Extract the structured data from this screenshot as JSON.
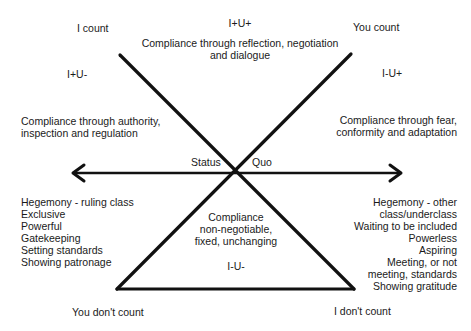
{
  "diagram": {
    "corners": {
      "top_left": "I count",
      "top_right": "You count",
      "bottom_left": "You don't count",
      "bottom_right": "I don't count"
    },
    "quadrants": {
      "top": {
        "code": "I+U+",
        "description_lines": [
          "Compliance through reflection, negotiation",
          "and dialogue"
        ]
      },
      "left": {
        "code": "I+U-",
        "description_lines": [
          "Compliance through authority,",
          "inspection and regulation"
        ]
      },
      "right": {
        "code": "I-U+",
        "description_lines": [
          "Compliance through fear,",
          "conformity and adaptation"
        ]
      },
      "bottom": {
        "code": "I-U-",
        "description_lines": [
          "Compliance",
          "non-negotiable,",
          "fixed, unchanging"
        ]
      }
    },
    "axis": {
      "left_label": "Status",
      "right_label": "Quo"
    },
    "left_list": [
      "Hegemony - ruling class",
      "Exclusive",
      "Powerful",
      "Gatekeeping",
      "Setting standards",
      "Showing patronage"
    ],
    "right_list": [
      "Hegemony - other",
      "class/underclass",
      "Waiting to be included",
      "Powerless",
      "Aspiring",
      "Meeting, or not",
      "meeting, standards",
      "Showing gratitude"
    ],
    "colors": {
      "line": "#111111",
      "text": "#1a1a1a",
      "background": "#ffffff"
    }
  }
}
